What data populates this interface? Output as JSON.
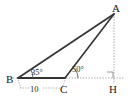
{
  "figure": {
    "kind": "geometry-diagram",
    "stroke_color": "#333333",
    "dotted_color": "#8a8a8a",
    "background": "#ffffff"
  },
  "points": {
    "a": {
      "label": "A",
      "x": 114,
      "y": 14,
      "label_x": 112,
      "label_y": 10
    },
    "b": {
      "label": "B",
      "x": 18,
      "y": 78,
      "label_x": 10,
      "label_y": 82
    },
    "c": {
      "label": "C",
      "x": 65,
      "y": 78,
      "label_x": 62,
      "label_y": 92
    },
    "h": {
      "label": "H",
      "x": 114,
      "y": 78,
      "label_x": 110,
      "label_y": 92
    }
  },
  "angles": {
    "at_b": {
      "label": "35°",
      "value": 35,
      "label_x": 30,
      "label_y": 74
    },
    "at_c": {
      "label": "50°",
      "value": 50,
      "label_x": 72,
      "label_y": 71
    }
  },
  "lengths": {
    "bc": {
      "label": "10",
      "value": 10,
      "label_x": 33,
      "label_y": 94
    }
  },
  "marks": {
    "right_angle_at_h": {
      "present": true,
      "size": 6
    }
  }
}
